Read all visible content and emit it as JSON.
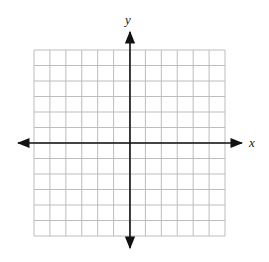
{
  "chart_data": {
    "type": "grid",
    "title": "",
    "xlabel": "x",
    "ylabel": "y",
    "grid": true,
    "grid_cells": {
      "columns": 12,
      "rows": 12
    },
    "xlim": [
      -6,
      6
    ],
    "ylim": [
      -6,
      6
    ],
    "arrows": true,
    "tick_labels": []
  },
  "labels": {
    "x_axis": "x",
    "y_axis": "y"
  },
  "colors": {
    "grid": "#bdbdbd",
    "axis": "#111111"
  }
}
